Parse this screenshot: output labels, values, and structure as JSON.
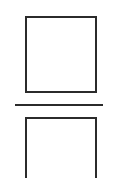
{
  "diagram": {
    "elements": [
      {
        "type": "square",
        "name": "top-square",
        "stroke": "#2b2b2b",
        "fill": "#ffffff"
      },
      {
        "type": "horizontal-line",
        "name": "divider-line",
        "stroke": "#2b2b2b"
      },
      {
        "type": "square",
        "name": "bottom-square",
        "stroke": "#2b2b2b",
        "fill": "#ffffff",
        "clipped": true
      }
    ],
    "background": "#ffffff"
  }
}
